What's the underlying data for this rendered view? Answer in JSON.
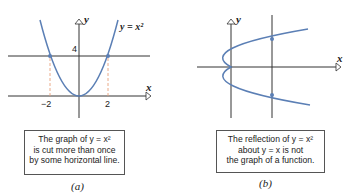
{
  "colors": {
    "curve": "#5b7fb5",
    "axis": "#333333",
    "dash": "#e8a07c"
  },
  "panel_a": {
    "curve_label": "y = x²",
    "axis_y": "y",
    "axis_x": "x",
    "tick_y": "4",
    "tick_x_neg": "−2",
    "tick_x_pos": "2",
    "caption_lines": [
      "The graph of y = x²",
      "is cut more than once",
      "by some horizontal line."
    ],
    "label": "(a)"
  },
  "panel_b": {
    "axis_y": "y",
    "axis_x": "x",
    "caption_lines": [
      "The reflection of y = x²",
      "about y = x is not",
      "the graph of a function."
    ],
    "label": "(b)"
  }
}
